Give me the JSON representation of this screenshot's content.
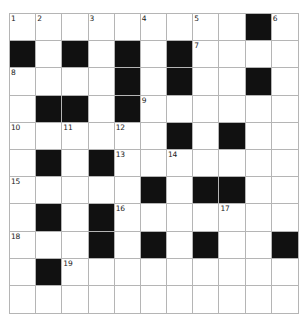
{
  "puzzle": {
    "type": "crossword-grid",
    "rows": 11,
    "columns": 11,
    "colors": {
      "block": "#111111",
      "empty": "#ffffff",
      "gridline": "#b5b5b5",
      "number": "#1a1a1a",
      "background": "#ffffff"
    },
    "cells": [
      [
        {
          "block": false,
          "number": "1"
        },
        {
          "block": false,
          "number": "2"
        },
        {
          "block": false,
          "number": ""
        },
        {
          "block": false,
          "number": "3"
        },
        {
          "block": false,
          "number": ""
        },
        {
          "block": false,
          "number": "4"
        },
        {
          "block": false,
          "number": ""
        },
        {
          "block": false,
          "number": "5"
        },
        {
          "block": false,
          "number": ""
        },
        {
          "block": true,
          "number": ""
        },
        {
          "block": false,
          "number": "6"
        }
      ],
      [
        {
          "block": true,
          "number": ""
        },
        {
          "block": false,
          "number": ""
        },
        {
          "block": true,
          "number": ""
        },
        {
          "block": false,
          "number": ""
        },
        {
          "block": true,
          "number": ""
        },
        {
          "block": false,
          "number": ""
        },
        {
          "block": true,
          "number": ""
        },
        {
          "block": false,
          "number": "7"
        },
        {
          "block": false,
          "number": ""
        },
        {
          "block": false,
          "number": ""
        },
        {
          "block": false,
          "number": ""
        }
      ],
      [
        {
          "block": false,
          "number": "8"
        },
        {
          "block": false,
          "number": ""
        },
        {
          "block": false,
          "number": ""
        },
        {
          "block": false,
          "number": ""
        },
        {
          "block": true,
          "number": ""
        },
        {
          "block": false,
          "number": ""
        },
        {
          "block": true,
          "number": ""
        },
        {
          "block": false,
          "number": ""
        },
        {
          "block": false,
          "number": ""
        },
        {
          "block": true,
          "number": ""
        },
        {
          "block": false,
          "number": ""
        }
      ],
      [
        {
          "block": false,
          "number": ""
        },
        {
          "block": true,
          "number": ""
        },
        {
          "block": true,
          "number": ""
        },
        {
          "block": false,
          "number": ""
        },
        {
          "block": true,
          "number": ""
        },
        {
          "block": false,
          "number": "9"
        },
        {
          "block": false,
          "number": ""
        },
        {
          "block": false,
          "number": ""
        },
        {
          "block": false,
          "number": ""
        },
        {
          "block": false,
          "number": ""
        },
        {
          "block": false,
          "number": ""
        }
      ],
      [
        {
          "block": false,
          "number": "10"
        },
        {
          "block": false,
          "number": ""
        },
        {
          "block": false,
          "number": "11"
        },
        {
          "block": false,
          "number": ""
        },
        {
          "block": false,
          "number": "12"
        },
        {
          "block": false,
          "number": ""
        },
        {
          "block": true,
          "number": ""
        },
        {
          "block": false,
          "number": ""
        },
        {
          "block": true,
          "number": ""
        },
        {
          "block": false,
          "number": ""
        },
        {
          "block": false,
          "number": ""
        }
      ],
      [
        {
          "block": false,
          "number": ""
        },
        {
          "block": true,
          "number": ""
        },
        {
          "block": false,
          "number": ""
        },
        {
          "block": true,
          "number": ""
        },
        {
          "block": false,
          "number": "13"
        },
        {
          "block": false,
          "number": ""
        },
        {
          "block": false,
          "number": "14"
        },
        {
          "block": false,
          "number": ""
        },
        {
          "block": false,
          "number": ""
        },
        {
          "block": false,
          "number": ""
        },
        {
          "block": false,
          "number": ""
        }
      ],
      [
        {
          "block": false,
          "number": "15"
        },
        {
          "block": false,
          "number": ""
        },
        {
          "block": false,
          "number": ""
        },
        {
          "block": false,
          "number": ""
        },
        {
          "block": false,
          "number": ""
        },
        {
          "block": true,
          "number": ""
        },
        {
          "block": false,
          "number": ""
        },
        {
          "block": true,
          "number": ""
        },
        {
          "block": true,
          "number": ""
        },
        {
          "block": false,
          "number": ""
        },
        {
          "block": false,
          "number": ""
        }
      ],
      [
        {
          "block": false,
          "number": ""
        },
        {
          "block": true,
          "number": ""
        },
        {
          "block": false,
          "number": ""
        },
        {
          "block": true,
          "number": ""
        },
        {
          "block": false,
          "number": "16"
        },
        {
          "block": false,
          "number": ""
        },
        {
          "block": false,
          "number": ""
        },
        {
          "block": false,
          "number": ""
        },
        {
          "block": false,
          "number": "17"
        },
        {
          "block": false,
          "number": ""
        },
        {
          "block": false,
          "number": ""
        }
      ],
      [
        {
          "block": false,
          "number": "18"
        },
        {
          "block": false,
          "number": ""
        },
        {
          "block": false,
          "number": ""
        },
        {
          "block": true,
          "number": ""
        },
        {
          "block": false,
          "number": ""
        },
        {
          "block": true,
          "number": ""
        },
        {
          "block": false,
          "number": ""
        },
        {
          "block": true,
          "number": ""
        },
        {
          "block": false,
          "number": ""
        },
        {
          "block": false,
          "number": ""
        },
        {
          "block": true,
          "number": ""
        }
      ],
      [
        {
          "block": false,
          "number": ""
        },
        {
          "block": true,
          "number": ""
        },
        {
          "block": false,
          "number": "19"
        },
        {
          "block": false,
          "number": ""
        },
        {
          "block": false,
          "number": ""
        },
        {
          "block": false,
          "number": ""
        },
        {
          "block": false,
          "number": ""
        },
        {
          "block": false,
          "number": ""
        },
        {
          "block": false,
          "number": ""
        },
        {
          "block": false,
          "number": ""
        },
        {
          "block": false,
          "number": ""
        }
      ],
      [
        {
          "block": false,
          "number": ""
        },
        {
          "block": false,
          "number": ""
        },
        {
          "block": false,
          "number": ""
        },
        {
          "block": false,
          "number": ""
        },
        {
          "block": false,
          "number": ""
        },
        {
          "block": false,
          "number": ""
        },
        {
          "block": false,
          "number": ""
        },
        {
          "block": false,
          "number": ""
        },
        {
          "block": false,
          "number": ""
        },
        {
          "block": false,
          "number": ""
        },
        {
          "block": false,
          "number": ""
        }
      ]
    ]
  }
}
